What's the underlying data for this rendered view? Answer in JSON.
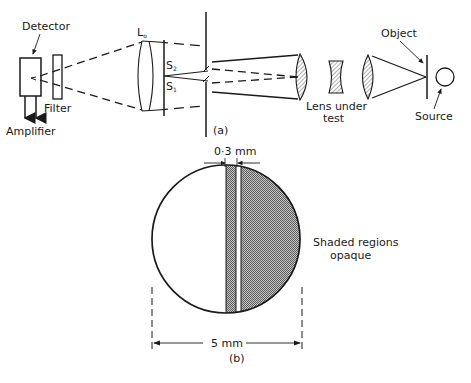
{
  "figure": {
    "part_a": {
      "caption": "(a)",
      "labels": {
        "detector": "Detector",
        "filter": "Filter",
        "amplifier": "Amplifier",
        "lens_l0": "L",
        "lens_l0_sub": "o",
        "slit_s2": "S",
        "slit_s2_sub": "2",
        "slit_s1": "S",
        "slit_s1_sub": "1",
        "lens_under_test_line1": "Lens under",
        "lens_under_test_line2": "test",
        "object": "Object",
        "source": "Source"
      }
    },
    "part_b": {
      "caption": "(b)",
      "labels": {
        "slit_width": "0·3 mm",
        "diameter": "5 mm",
        "shaded_line1": "Shaded regions",
        "shaded_line2": "opaque"
      }
    }
  },
  "colors": {
    "ink": "#1a1a1a",
    "background": "#ffffff",
    "hatch_fill": "#9a9a9a"
  }
}
